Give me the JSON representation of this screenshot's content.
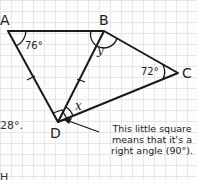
{
  "diagram": {
    "type": "quadrilateral-with-diagonal",
    "vertices": {
      "A": {
        "label": "A"
      },
      "B": {
        "label": "B"
      },
      "C": {
        "label": "C"
      },
      "D": {
        "label": "D"
      }
    },
    "angles": {
      "A": "76°",
      "B": "y",
      "C": "72°",
      "D": "x"
    },
    "callout": "This little square means that it's a right angle (90°).",
    "fragments": {
      "left_text": "28°.",
      "bottom_text": "H"
    },
    "colors": {
      "line": "#1a1a1a",
      "grid": "#e6e6e6",
      "background": "#fdfdfd"
    }
  }
}
